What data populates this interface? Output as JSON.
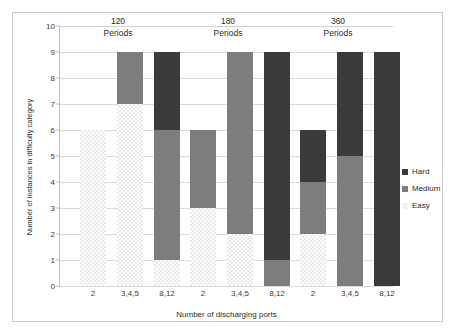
{
  "chart_data": {
    "type": "bar",
    "stacked": true,
    "title": "",
    "xlabel": "Number of discharging ports",
    "ylabel": "Number of instances in difficulty category",
    "ylim": [
      0,
      10
    ],
    "ytick_values": [
      0,
      1,
      2,
      3,
      4,
      5,
      6,
      7,
      8,
      9,
      10
    ],
    "ytick_labels": [
      "0",
      "1",
      "2",
      "3",
      "4",
      "5",
      "6",
      "7",
      "8",
      "9",
      "10"
    ],
    "grid": true,
    "legend_position": "right",
    "legend_entries": [
      "Hard",
      "Medium",
      "Easy"
    ],
    "categories": [
      "2",
      "3,4,5",
      "8,12",
      "2",
      "3,4,5",
      "8,12",
      "2",
      "3,4,5",
      "8,12"
    ],
    "groups": [
      {
        "value": "120",
        "unit": "Periods",
        "bars": [
          {
            "category": "2",
            "easy": 6,
            "medium": 0,
            "hard": 0,
            "total": 6
          },
          {
            "category": "3,4,5",
            "easy": 7,
            "medium": 2,
            "hard": 0,
            "total": 9
          },
          {
            "category": "8,12",
            "easy": 1,
            "medium": 5,
            "hard": 3,
            "total": 9
          }
        ]
      },
      {
        "value": "180",
        "unit": "Periods",
        "bars": [
          {
            "category": "2",
            "easy": 3,
            "medium": 3,
            "hard": 0,
            "total": 6
          },
          {
            "category": "3,4,5",
            "easy": 2,
            "medium": 7,
            "hard": 0,
            "total": 9
          },
          {
            "category": "8,12",
            "easy": 0,
            "medium": 1,
            "hard": 8,
            "total": 9
          }
        ]
      },
      {
        "value": "360",
        "unit": "Periods",
        "bars": [
          {
            "category": "2",
            "easy": 2,
            "medium": 2,
            "hard": 2,
            "total": 6
          },
          {
            "category": "3,4,5",
            "easy": 0,
            "medium": 5,
            "hard": 4,
            "total": 9
          },
          {
            "category": "8,12",
            "easy": 0,
            "medium": 0,
            "hard": 9,
            "total": 9
          }
        ]
      }
    ],
    "series": [
      {
        "name": "Easy",
        "values": [
          6,
          7,
          1,
          3,
          2,
          0,
          2,
          0,
          0
        ],
        "color": "#e9e9e9"
      },
      {
        "name": "Medium",
        "values": [
          0,
          2,
          5,
          3,
          7,
          1,
          2,
          5,
          0
        ],
        "color": "#7d7d7d"
      },
      {
        "name": "Hard",
        "values": [
          0,
          0,
          3,
          0,
          0,
          8,
          2,
          4,
          9
        ],
        "color": "#3a3a3a"
      }
    ]
  },
  "legend": {
    "hard": "Hard",
    "medium": "Medium",
    "easy": "Easy"
  },
  "axes": {
    "y_title": "Number of instances in difficulty category",
    "x_title": "Number of discharging ports"
  }
}
